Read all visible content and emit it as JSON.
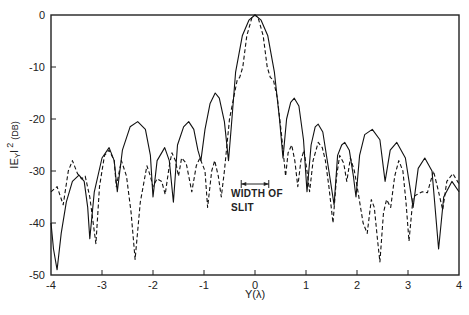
{
  "chart_data": {
    "type": "line",
    "title": "",
    "xlabel": "Y(λ)",
    "ylabel": "|E_Y|² (DB)",
    "ylabel_parts": {
      "main": "IE",
      "sub": "Y",
      "bar": "I",
      "sup": "2",
      "unit": "(DB)"
    },
    "xlim": [
      -4,
      4
    ],
    "ylim": [
      -50,
      0
    ],
    "xticks": [
      -4,
      -3,
      -2,
      -1,
      0,
      1,
      2,
      3,
      4
    ],
    "xtick_labels": [
      "-4",
      "-3",
      "-2",
      "-1",
      "0",
      "1",
      "2",
      "3",
      "4"
    ],
    "yticks": [
      0,
      -10,
      -20,
      -30,
      -40,
      -50
    ],
    "ytick_labels": [
      "0",
      "-10",
      "-20",
      "-30",
      "-40",
      "-50"
    ],
    "grid": false,
    "legend": null,
    "annotations": [
      {
        "text_line1": "WIDTH OF",
        "text_line2": "SLIT",
        "bracket_x": [
          -0.27,
          0.27
        ],
        "bracket_y": -32.5
      }
    ],
    "series": [
      {
        "name": "solid",
        "style": "solid",
        "color": "#111111",
        "points": [
          [
            -4,
            -40
          ],
          [
            -3.95,
            -45
          ],
          [
            -3.88,
            -49
          ],
          [
            -3.8,
            -42
          ],
          [
            -3.7,
            -36
          ],
          [
            -3.58,
            -32
          ],
          [
            -3.45,
            -30.8
          ],
          [
            -3.35,
            -32
          ],
          [
            -3.28,
            -37
          ],
          [
            -3.24,
            -43
          ],
          [
            -3.15,
            -34
          ],
          [
            -3.0,
            -27.5
          ],
          [
            -2.86,
            -25.5
          ],
          [
            -2.76,
            -28
          ],
          [
            -2.7,
            -34
          ],
          [
            -2.6,
            -26
          ],
          [
            -2.45,
            -21.5
          ],
          [
            -2.3,
            -20.5
          ],
          [
            -2.15,
            -22
          ],
          [
            -2.05,
            -27
          ],
          [
            -2.0,
            -35
          ],
          [
            -1.92,
            -28
          ],
          [
            -1.77,
            -25.5
          ],
          [
            -1.68,
            -28
          ],
          [
            -1.6,
            -36
          ],
          [
            -1.52,
            -25
          ],
          [
            -1.4,
            -21.5
          ],
          [
            -1.3,
            -20.5
          ],
          [
            -1.2,
            -22
          ],
          [
            -1.12,
            -26
          ],
          [
            -1.06,
            -28
          ],
          [
            -0.98,
            -22
          ],
          [
            -0.88,
            -17
          ],
          [
            -0.78,
            -15
          ],
          [
            -0.7,
            -16
          ],
          [
            -0.6,
            -20.5
          ],
          [
            -0.52,
            -28
          ],
          [
            -0.46,
            -21
          ],
          [
            -0.38,
            -11
          ],
          [
            -0.25,
            -4
          ],
          [
            -0.12,
            -1
          ],
          [
            0,
            0
          ],
          [
            0.12,
            -1
          ],
          [
            0.25,
            -4
          ],
          [
            0.38,
            -11
          ],
          [
            0.48,
            -20
          ],
          [
            0.55,
            -27.5
          ],
          [
            0.62,
            -20
          ],
          [
            0.7,
            -16.8
          ],
          [
            0.77,
            -16
          ],
          [
            0.86,
            -17.5
          ],
          [
            0.95,
            -24
          ],
          [
            1.02,
            -34
          ],
          [
            1.1,
            -25
          ],
          [
            1.18,
            -21.5
          ],
          [
            1.24,
            -21
          ],
          [
            1.33,
            -22.5
          ],
          [
            1.45,
            -30
          ],
          [
            1.55,
            -36.5
          ],
          [
            1.62,
            -27
          ],
          [
            1.7,
            -25
          ],
          [
            1.76,
            -24.5
          ],
          [
            1.85,
            -26
          ],
          [
            1.93,
            -31
          ],
          [
            1.98,
            -35
          ],
          [
            2.05,
            -27
          ],
          [
            2.15,
            -23
          ],
          [
            2.3,
            -22
          ],
          [
            2.45,
            -24
          ],
          [
            2.55,
            -32
          ],
          [
            2.65,
            -26
          ],
          [
            2.78,
            -24.5
          ],
          [
            2.95,
            -27.5
          ],
          [
            3.1,
            -37
          ],
          [
            3.2,
            -29.5
          ],
          [
            3.33,
            -27.5
          ],
          [
            3.47,
            -30
          ],
          [
            3.6,
            -45
          ],
          [
            3.7,
            -35
          ],
          [
            3.86,
            -32
          ],
          [
            4,
            -34
          ]
        ]
      },
      {
        "name": "dashed",
        "style": "dashed",
        "color": "#111111",
        "points": [
          [
            -4,
            -34
          ],
          [
            -3.88,
            -33
          ],
          [
            -3.76,
            -36.5
          ],
          [
            -3.66,
            -30
          ],
          [
            -3.58,
            -28
          ],
          [
            -3.48,
            -30.5
          ],
          [
            -3.4,
            -31.5
          ],
          [
            -3.33,
            -31
          ],
          [
            -3.24,
            -35
          ],
          [
            -3.12,
            -44
          ],
          [
            -3.05,
            -33
          ],
          [
            -2.95,
            -27
          ],
          [
            -2.86,
            -26
          ],
          [
            -2.76,
            -28
          ],
          [
            -2.72,
            -33
          ],
          [
            -2.62,
            -28
          ],
          [
            -2.52,
            -31
          ],
          [
            -2.43,
            -38
          ],
          [
            -2.35,
            -47
          ],
          [
            -2.25,
            -36
          ],
          [
            -2.12,
            -29
          ],
          [
            -2.05,
            -31
          ],
          [
            -2.0,
            -33
          ],
          [
            -1.92,
            -31.5
          ],
          [
            -1.83,
            -32
          ],
          [
            -1.76,
            -34.5
          ],
          [
            -1.68,
            -29
          ],
          [
            -1.63,
            -26.5
          ],
          [
            -1.56,
            -28
          ],
          [
            -1.5,
            -31
          ],
          [
            -1.44,
            -27.5
          ],
          [
            -1.35,
            -28.5
          ],
          [
            -1.24,
            -34
          ],
          [
            -1.15,
            -29
          ],
          [
            -1.08,
            -27.5
          ],
          [
            -0.98,
            -30
          ],
          [
            -0.93,
            -37
          ],
          [
            -0.85,
            -30
          ],
          [
            -0.79,
            -28
          ],
          [
            -0.72,
            -31
          ],
          [
            -0.66,
            -35
          ],
          [
            -0.6,
            -30
          ],
          [
            -0.5,
            -20
          ],
          [
            -0.4,
            -15
          ],
          [
            -0.35,
            -12.5
          ],
          [
            -0.3,
            -12
          ],
          [
            -0.24,
            -10
          ],
          [
            -0.16,
            -4
          ],
          [
            -0.06,
            -0.5
          ],
          [
            0,
            0
          ],
          [
            0.06,
            -0.5
          ],
          [
            0.16,
            -4
          ],
          [
            0.24,
            -10
          ],
          [
            0.3,
            -12
          ],
          [
            0.36,
            -12.5
          ],
          [
            0.44,
            -16
          ],
          [
            0.52,
            -23
          ],
          [
            0.6,
            -31
          ],
          [
            0.65,
            -26.5
          ],
          [
            0.72,
            -25
          ],
          [
            0.78,
            -28
          ],
          [
            0.84,
            -33
          ],
          [
            0.9,
            -28
          ],
          [
            0.96,
            -26
          ],
          [
            1.02,
            -30
          ],
          [
            1.07,
            -34
          ],
          [
            1.14,
            -28
          ],
          [
            1.24,
            -24.5
          ],
          [
            1.32,
            -25.5
          ],
          [
            1.38,
            -28
          ],
          [
            1.45,
            -33
          ],
          [
            1.53,
            -40
          ],
          [
            1.6,
            -31
          ],
          [
            1.66,
            -27
          ],
          [
            1.74,
            -28.5
          ],
          [
            1.8,
            -32
          ],
          [
            1.87,
            -27.5
          ],
          [
            1.95,
            -30
          ],
          [
            2.02,
            -34
          ],
          [
            2.12,
            -40
          ],
          [
            2.2,
            -42
          ],
          [
            2.28,
            -35.5
          ],
          [
            2.34,
            -37
          ],
          [
            2.4,
            -43
          ],
          [
            2.45,
            -47.5
          ],
          [
            2.52,
            -38
          ],
          [
            2.58,
            -35.5
          ],
          [
            2.66,
            -37
          ],
          [
            2.74,
            -31
          ],
          [
            2.82,
            -28
          ],
          [
            2.9,
            -30
          ],
          [
            2.96,
            -36
          ],
          [
            3.02,
            -43.5
          ],
          [
            3.1,
            -35
          ],
          [
            3.18,
            -34.5
          ],
          [
            3.28,
            -34
          ],
          [
            3.38,
            -34.2
          ],
          [
            3.5,
            -30
          ],
          [
            3.6,
            -34
          ],
          [
            3.68,
            -37.5
          ],
          [
            3.76,
            -32
          ],
          [
            3.88,
            -30.5
          ],
          [
            4,
            -32.5
          ]
        ]
      }
    ]
  }
}
